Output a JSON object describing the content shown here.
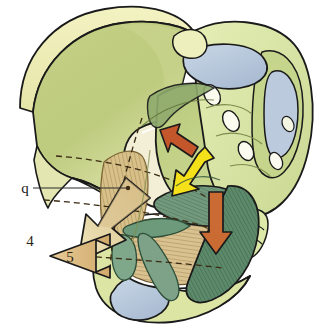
{
  "figure": {
    "view": "oblique lateral view of right hemipelvis and sacrum",
    "background_color": "#ffffff"
  },
  "labels": {
    "q": "q",
    "arrow4": "4",
    "arrow5": "5"
  },
  "annotations": [
    {
      "id": "q",
      "text": "q",
      "type": "leader-label",
      "target": "hatched fibres of the iliac fossa / obturator region",
      "leader": "horizontal line running right from the letter to a dot on the hatched fibre field"
    },
    {
      "id": "4",
      "text": "4",
      "type": "force-arrow-label",
      "arrow_direction": "down-left",
      "arrow_color": "#e8dba6"
    },
    {
      "id": "5",
      "text": "5",
      "type": "force-arrow-label",
      "arrow_direction": "left",
      "arrow_color": "#dcb87c"
    }
  ],
  "force_arrows": [
    {
      "name": "red-arrow-up-left",
      "color": "#c4562c",
      "outline": "#1a1a1a",
      "direction": "up-left",
      "region": "acetabular roof / pelvic brim"
    },
    {
      "name": "yellow-arrow-down-left",
      "color": "#f5e119",
      "outline": "#1a1a1a",
      "direction": "down-left",
      "region": "sacral promontory toward ischium"
    },
    {
      "name": "orange-arrow-down",
      "color": "#c96b33",
      "outline": "#1a1a1a",
      "direction": "down",
      "region": "greater sciatic notch / sacrotuberous ligament"
    },
    {
      "name": "tan-arrow-4",
      "color": "#e8dba6",
      "outline": "#1a1a1a",
      "direction": "down-left",
      "region": "anterior-inferior, exits pelvis to the lower left"
    },
    {
      "name": "tan-arrow-5",
      "color": "#dcb87c",
      "outline": "#1a1a1a",
      "direction": "left",
      "region": "pubic ramus, exits pelvis to the left"
    }
  ],
  "anatomy_parts": [
    {
      "name": "iliac-wing",
      "fill": "#bccb7f",
      "outline": "#1a1a1a"
    },
    {
      "name": "iliac-crest",
      "fill": "#eeeeb4",
      "outline": "#1a1a1a"
    },
    {
      "name": "sacrum",
      "fill": "#dde9a9",
      "outline": "#1a1a1a"
    },
    {
      "name": "sacral-ala",
      "fill": "#b9cc7c",
      "outline": "#1a1a1a"
    },
    {
      "name": "sacroiliac-joint-cartilage",
      "fill": "#b9c9dd",
      "outline": "#1a1a1a"
    },
    {
      "name": "pubic-symphysis-cartilage",
      "fill": "#ccd6e3",
      "outline": "#1a1a1a"
    },
    {
      "name": "coccyx",
      "fill": "#dde9a9",
      "outline": "#1a1a1a"
    },
    {
      "name": "obturator-membrane",
      "fill": "#d9c190",
      "outline": "#6b5530"
    },
    {
      "name": "iliac-fossa-fibres",
      "fill": "#d8c089",
      "outline": "#7a6234"
    },
    {
      "name": "sacrotuberous-ligament",
      "fill": "#5d8a6a",
      "outline": "#1a1a1a"
    },
    {
      "name": "sacrospinous-ligament",
      "fill": "#79a083",
      "outline": "#1a1a1a"
    },
    {
      "name": "sacral-foramina",
      "fill": "#fbfbf0",
      "outline": "#1a1a1a"
    },
    {
      "name": "obturator-foramen",
      "fill": "#ffffff",
      "outline": "#1a1a1a"
    },
    {
      "name": "projection-dashed-lines",
      "stroke": "#3a2a12",
      "style": "dashed"
    }
  ],
  "colors": {
    "bone_light": "#eeeeb4",
    "bone_mid": "#dde9a9",
    "bone_green": "#bccb7f",
    "cartilage_blue": "#b9c9dd",
    "ligament_green": "#5d8a6a",
    "fibre_tan": "#d9c190",
    "arrow_red": "#c4562c",
    "arrow_yellow": "#f5e119",
    "arrow_orange": "#c96b33",
    "arrow_tan_light": "#e8dba6",
    "arrow_tan_dark": "#dcb87c",
    "outline": "#1a1a1a",
    "background": "#ffffff"
  }
}
